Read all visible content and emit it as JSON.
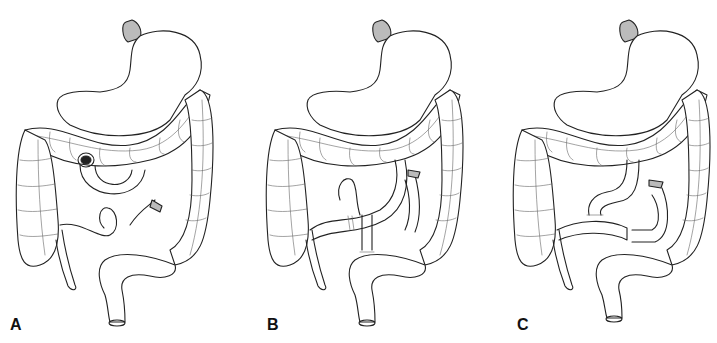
{
  "figure": {
    "panels": [
      {
        "id": "A",
        "label": "A",
        "description": "Normal anatomy: stomach, transverse colon, duodenum/jejunum, ascending and descending colon, rectum"
      },
      {
        "id": "B",
        "label": "B",
        "description": "Surgical reconstruction with small bowel loop passed through to colon with sutured anastomoses"
      },
      {
        "id": "C",
        "label": "C",
        "description": "Alternative reconstruction with jejunal anastomosis below transverse colon"
      }
    ],
    "colors": {
      "background": "#ffffff",
      "ink": "#222222"
    }
  }
}
